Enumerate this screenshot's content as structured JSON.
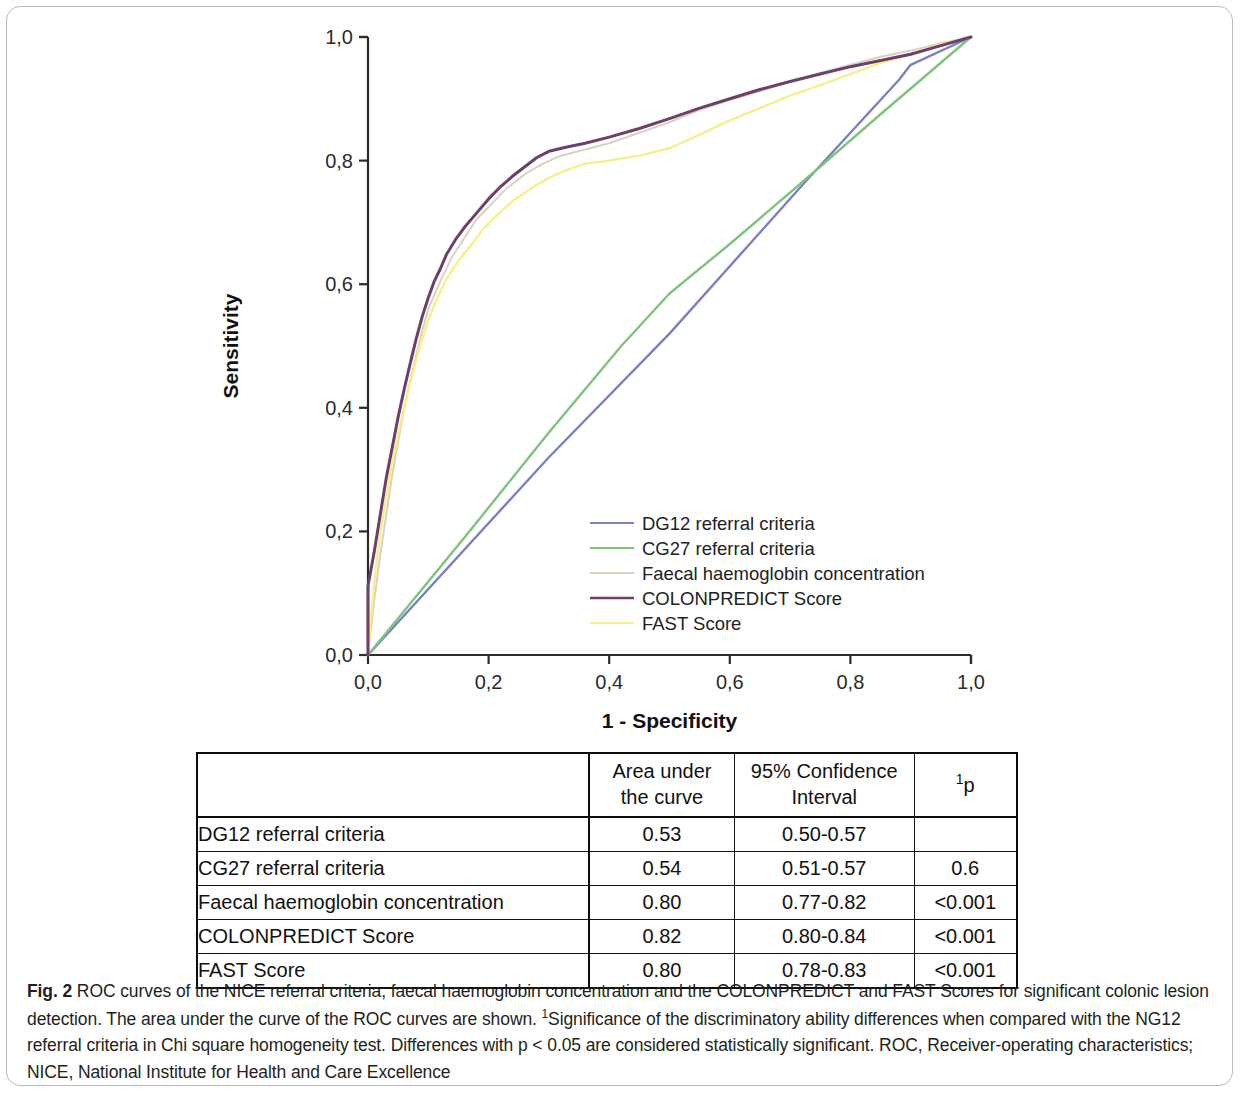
{
  "figure": {
    "label": "Fig. 2",
    "caption_text": " ROC curves of the NICE referral criteria, faecal haemoglobin concentration and the COLONPREDICT and FAST Scores for significant colonic lesion detection. The area under the curve of the ROC curves are shown. ",
    "caption_sup": "1",
    "caption_text_2": "Significance of the discriminatory ability differences when compared with the NG12 referral criteria in Chi square homogeneity test. Differences with p < 0.05 are considered statistically significant. ROC, Receiver-operating characteristics; NICE, National Institute for Health and Care Excellence"
  },
  "chart_data": {
    "type": "line",
    "title": "",
    "xlabel": "1 - Specificity",
    "ylabel": "Sensitivity",
    "xlim": [
      0,
      1
    ],
    "ylim": [
      0,
      1
    ],
    "grid": false,
    "legend_position": "center-right-inside",
    "xticks": [
      "0,0",
      "0,2",
      "0,4",
      "0,6",
      "0,8",
      "1,0"
    ],
    "xtick_values": [
      0.0,
      0.2,
      0.4,
      0.6,
      0.8,
      1.0
    ],
    "yticks": [
      "0,0",
      "0,2",
      "0,4",
      "0,6",
      "0,8",
      "1,0"
    ],
    "ytick_values": [
      0.0,
      0.2,
      0.4,
      0.6,
      0.8,
      1.0
    ],
    "series": [
      {
        "name": "DG12 referral criteria",
        "color": "#7b80c4",
        "auc": 0.53,
        "points": [
          [
            0,
            0
          ],
          [
            0.3,
            0.32
          ],
          [
            0.5,
            0.52
          ],
          [
            0.72,
            0.76
          ],
          [
            0.88,
            0.93
          ],
          [
            0.9,
            0.955
          ],
          [
            1.0,
            1.0
          ]
        ]
      },
      {
        "name": "CG27 referral criteria",
        "color": "#7cc47c",
        "auc": 0.54,
        "points": [
          [
            0,
            0
          ],
          [
            0.16,
            0.19
          ],
          [
            0.3,
            0.36
          ],
          [
            0.42,
            0.5
          ],
          [
            0.5,
            0.585
          ],
          [
            0.6,
            0.665
          ],
          [
            0.72,
            0.765
          ],
          [
            0.85,
            0.875
          ],
          [
            1.0,
            1.0
          ]
        ]
      },
      {
        "name": "Faecal haemoglobin concentration",
        "color": "#d8d3c0",
        "auc": 0.8,
        "points": [
          [
            0,
            0
          ],
          [
            0.01,
            0.085
          ],
          [
            0.02,
            0.16
          ],
          [
            0.03,
            0.225
          ],
          [
            0.04,
            0.29
          ],
          [
            0.05,
            0.345
          ],
          [
            0.06,
            0.4
          ],
          [
            0.07,
            0.445
          ],
          [
            0.08,
            0.485
          ],
          [
            0.09,
            0.525
          ],
          [
            0.1,
            0.56
          ],
          [
            0.12,
            0.605
          ],
          [
            0.14,
            0.645
          ],
          [
            0.16,
            0.675
          ],
          [
            0.18,
            0.705
          ],
          [
            0.2,
            0.725
          ],
          [
            0.23,
            0.755
          ],
          [
            0.26,
            0.778
          ],
          [
            0.29,
            0.795
          ],
          [
            0.32,
            0.808
          ],
          [
            0.36,
            0.818
          ],
          [
            0.4,
            0.828
          ],
          [
            0.45,
            0.845
          ],
          [
            0.5,
            0.862
          ],
          [
            0.55,
            0.882
          ],
          [
            0.6,
            0.898
          ],
          [
            0.65,
            0.912
          ],
          [
            0.7,
            0.928
          ],
          [
            0.75,
            0.942
          ],
          [
            0.8,
            0.955
          ],
          [
            0.85,
            0.968
          ],
          [
            0.9,
            0.978
          ],
          [
            0.95,
            0.99
          ],
          [
            1.0,
            1.0
          ]
        ]
      },
      {
        "name": "COLONPREDICT Score",
        "color": "#6e3f67",
        "auc": 0.82,
        "points": [
          [
            0,
            0
          ],
          [
            0,
            0.112
          ],
          [
            0.01,
            0.165
          ],
          [
            0.02,
            0.225
          ],
          [
            0.03,
            0.285
          ],
          [
            0.04,
            0.335
          ],
          [
            0.05,
            0.385
          ],
          [
            0.06,
            0.43
          ],
          [
            0.07,
            0.472
          ],
          [
            0.08,
            0.512
          ],
          [
            0.09,
            0.548
          ],
          [
            0.1,
            0.578
          ],
          [
            0.11,
            0.605
          ],
          [
            0.12,
            0.625
          ],
          [
            0.13,
            0.648
          ],
          [
            0.145,
            0.672
          ],
          [
            0.16,
            0.692
          ],
          [
            0.18,
            0.715
          ],
          [
            0.2,
            0.738
          ],
          [
            0.22,
            0.758
          ],
          [
            0.24,
            0.775
          ],
          [
            0.26,
            0.79
          ],
          [
            0.28,
            0.805
          ],
          [
            0.3,
            0.815
          ],
          [
            0.33,
            0.822
          ],
          [
            0.36,
            0.828
          ],
          [
            0.4,
            0.838
          ],
          [
            0.45,
            0.852
          ],
          [
            0.5,
            0.868
          ],
          [
            0.55,
            0.885
          ],
          [
            0.6,
            0.9
          ],
          [
            0.65,
            0.915
          ],
          [
            0.7,
            0.928
          ],
          [
            0.75,
            0.94
          ],
          [
            0.8,
            0.952
          ],
          [
            0.85,
            0.962
          ],
          [
            0.9,
            0.972
          ],
          [
            0.95,
            0.986
          ],
          [
            1.0,
            1.0
          ]
        ]
      },
      {
        "name": "FAST Score",
        "color": "#f5f08a",
        "auc": 0.8,
        "points": [
          [
            0,
            0
          ],
          [
            0.005,
            0.06
          ],
          [
            0.012,
            0.13
          ],
          [
            0.02,
            0.195
          ],
          [
            0.03,
            0.255
          ],
          [
            0.04,
            0.31
          ],
          [
            0.05,
            0.358
          ],
          [
            0.06,
            0.4
          ],
          [
            0.07,
            0.44
          ],
          [
            0.08,
            0.478
          ],
          [
            0.09,
            0.512
          ],
          [
            0.1,
            0.542
          ],
          [
            0.115,
            0.578
          ],
          [
            0.13,
            0.608
          ],
          [
            0.15,
            0.638
          ],
          [
            0.17,
            0.662
          ],
          [
            0.19,
            0.688
          ],
          [
            0.21,
            0.708
          ],
          [
            0.24,
            0.735
          ],
          [
            0.27,
            0.755
          ],
          [
            0.3,
            0.772
          ],
          [
            0.33,
            0.785
          ],
          [
            0.36,
            0.795
          ],
          [
            0.4,
            0.8
          ],
          [
            0.45,
            0.808
          ],
          [
            0.5,
            0.82
          ],
          [
            0.55,
            0.842
          ],
          [
            0.6,
            0.865
          ],
          [
            0.65,
            0.885
          ],
          [
            0.7,
            0.905
          ],
          [
            0.75,
            0.922
          ],
          [
            0.8,
            0.94
          ],
          [
            0.85,
            0.958
          ],
          [
            0.9,
            0.972
          ],
          [
            0.95,
            0.988
          ],
          [
            1.0,
            1.0
          ]
        ]
      }
    ]
  },
  "legend": {
    "items": [
      {
        "label": "DG12 referral criteria",
        "color": "#7b80c4"
      },
      {
        "label": "CG27 referral criteria",
        "color": "#7cc47c"
      },
      {
        "label": "Faecal haemoglobin concentration",
        "color": "#d8d3c0"
      },
      {
        "label": "COLONPREDICT Score",
        "color": "#6e3f67"
      },
      {
        "label": "FAST Score",
        "color": "#f5f08a"
      }
    ]
  },
  "table": {
    "headers": {
      "blank": "",
      "auc_line1": "Area under",
      "auc_line2": "the curve",
      "ci_line1": "95% Confidence",
      "ci_line2": "Interval",
      "p_sup": "1",
      "p_text": "p"
    },
    "rows": [
      {
        "name": "DG12 referral criteria",
        "auc": "0.53",
        "ci": "0.50-0.57",
        "p": ""
      },
      {
        "name": "CG27 referral criteria",
        "auc": "0.54",
        "ci": "0.51-0.57",
        "p": "0.6"
      },
      {
        "name": "Faecal haemoglobin concentration",
        "auc": "0.80",
        "ci": "0.77-0.82",
        "p": "<0.001"
      },
      {
        "name": "COLONPREDICT Score",
        "auc": "0.82",
        "ci": "0.80-0.84",
        "p": "<0.001"
      },
      {
        "name": "FAST Score",
        "auc": "0.80",
        "ci": "0.78-0.83",
        "p": "<0.001"
      }
    ]
  }
}
